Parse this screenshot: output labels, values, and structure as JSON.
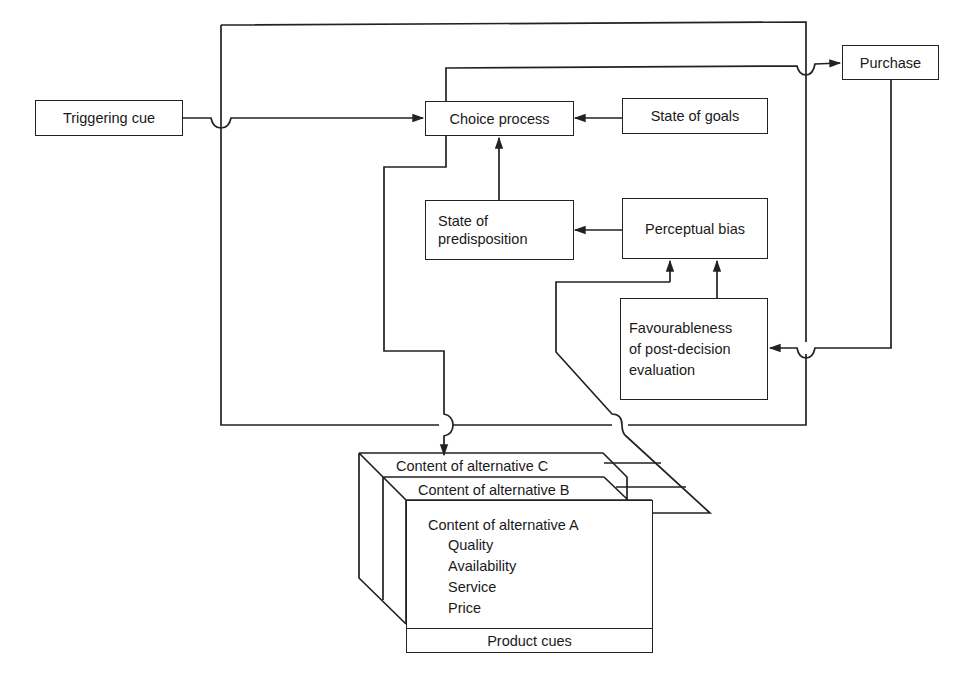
{
  "diagram": {
    "type": "flow-model",
    "nodes": {
      "triggering_cue": "Triggering cue",
      "choice_process": "Choice process",
      "state_of_goals": "State of goals",
      "purchase": "Purchase",
      "state_of_predisposition": "State of\npredisposition",
      "perceptual_bias": "Perceptual bias",
      "favourableness": "Favourableness\nof  post-decision\nevaluation",
      "alternative_c": "Content of alternative C",
      "alternative_b": "Content of alternative B",
      "alternative_a": "Content of alternative A",
      "product_cues": "Product cues"
    },
    "alternative_a_attributes": [
      "Quality",
      "Availability",
      "Service",
      "Price"
    ],
    "edges": [
      {
        "from": "Triggering cue",
        "to": "Choice process"
      },
      {
        "from": "State of goals",
        "to": "Choice process"
      },
      {
        "from": "State of predisposition",
        "to": "Choice process"
      },
      {
        "from": "Perceptual bias",
        "to": "State of predisposition"
      },
      {
        "from": "Favourableness of post-decision evaluation",
        "to": "Perceptual bias"
      },
      {
        "from": "Choice process",
        "to": "Purchase"
      },
      {
        "from": "Purchase",
        "to": "Favourableness of post-decision evaluation"
      },
      {
        "from": "Choice process",
        "to": "Content of alternatives"
      },
      {
        "from": "Content of alternatives",
        "to": "Perceptual bias"
      }
    ],
    "colors": {
      "line": "#222222",
      "background": "#ffffff"
    }
  }
}
